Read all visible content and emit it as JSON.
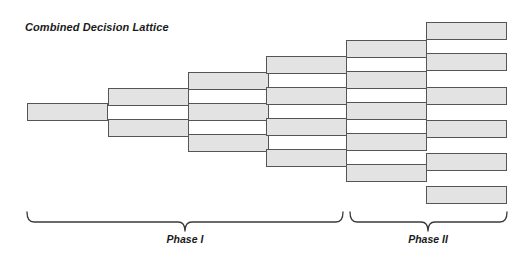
{
  "figure": {
    "title": "Combined Decision Lattice",
    "background_color": "#ffffff",
    "node_fill_color": "#e3e3e3",
    "node_stroke_color": "#555555",
    "text_color": "#1a1a1a"
  },
  "chart_data": {
    "type": "diagram",
    "title": "Combined Decision Lattice",
    "xlabel": "",
    "ylabel": "",
    "grid": false,
    "legend": false,
    "columns": [
      {
        "step": 1,
        "node_count": 1,
        "x": 27,
        "width": 81
      },
      {
        "step": 2,
        "node_count": 2,
        "x": 108,
        "width": 81
      },
      {
        "step": 3,
        "node_count": 3,
        "x": 188,
        "width": 81
      },
      {
        "step": 4,
        "node_count": 4,
        "x": 266,
        "width": 81
      },
      {
        "step": 5,
        "node_count": 5,
        "x": 346,
        "width": 81
      },
      {
        "step": 6,
        "node_count": 6,
        "x": 426,
        "width": 81
      }
    ],
    "nodes": [
      {
        "col": 1,
        "index": 1,
        "x": 27,
        "y": 103,
        "w": 81,
        "h": 18
      },
      {
        "col": 2,
        "index": 1,
        "x": 108,
        "y": 88,
        "w": 81,
        "h": 18
      },
      {
        "col": 2,
        "index": 2,
        "x": 108,
        "y": 119,
        "w": 81,
        "h": 18
      },
      {
        "col": 3,
        "index": 1,
        "x": 188,
        "y": 72,
        "w": 81,
        "h": 18
      },
      {
        "col": 3,
        "index": 2,
        "x": 188,
        "y": 103,
        "w": 81,
        "h": 18
      },
      {
        "col": 3,
        "index": 3,
        "x": 188,
        "y": 134,
        "w": 81,
        "h": 18
      },
      {
        "col": 4,
        "index": 1,
        "x": 266,
        "y": 56,
        "w": 81,
        "h": 18
      },
      {
        "col": 4,
        "index": 2,
        "x": 266,
        "y": 87,
        "w": 81,
        "h": 18
      },
      {
        "col": 4,
        "index": 3,
        "x": 266,
        "y": 118,
        "w": 81,
        "h": 18
      },
      {
        "col": 4,
        "index": 4,
        "x": 266,
        "y": 149,
        "w": 81,
        "h": 18
      },
      {
        "col": 5,
        "index": 1,
        "x": 346,
        "y": 40,
        "w": 81,
        "h": 18
      },
      {
        "col": 5,
        "index": 2,
        "x": 346,
        "y": 71,
        "w": 81,
        "h": 18
      },
      {
        "col": 5,
        "index": 3,
        "x": 346,
        "y": 102,
        "w": 81,
        "h": 18
      },
      {
        "col": 5,
        "index": 4,
        "x": 346,
        "y": 133,
        "w": 81,
        "h": 18
      },
      {
        "col": 5,
        "index": 5,
        "x": 346,
        "y": 164,
        "w": 81,
        "h": 18
      },
      {
        "col": 6,
        "index": 1,
        "x": 426,
        "y": 22,
        "w": 81,
        "h": 18
      },
      {
        "col": 6,
        "index": 2,
        "x": 426,
        "y": 53,
        "w": 81,
        "h": 18
      },
      {
        "col": 6,
        "index": 3,
        "x": 426,
        "y": 87,
        "w": 81,
        "h": 18
      },
      {
        "col": 6,
        "index": 4,
        "x": 426,
        "y": 120,
        "w": 81,
        "h": 18
      },
      {
        "col": 6,
        "index": 5,
        "x": 426,
        "y": 153,
        "w": 81,
        "h": 18
      },
      {
        "col": 6,
        "index": 6,
        "x": 426,
        "y": 186,
        "w": 81,
        "h": 18
      }
    ],
    "braces": [
      {
        "label": "Phase I",
        "x_start": 27,
        "x_end": 343,
        "label_x": 185,
        "label_y": 240
      },
      {
        "label": "Phase II",
        "x_start": 350,
        "x_end": 507,
        "label_x": 428,
        "label_y": 240
      }
    ]
  }
}
